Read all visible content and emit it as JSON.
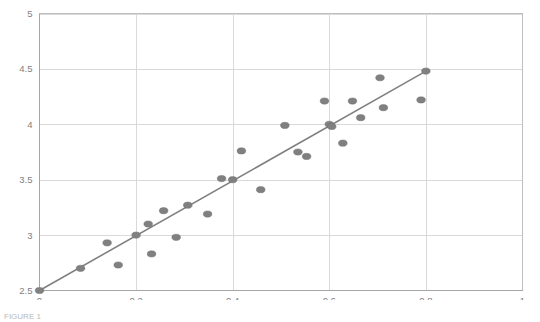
{
  "chart_data": {
    "type": "scatter",
    "title": "",
    "xlabel": "",
    "ylabel": "",
    "xlim": [
      0,
      1
    ],
    "ylim": [
      2.5,
      5
    ],
    "grid": true,
    "legend": null,
    "xticks": [
      "0",
      "0.2",
      "0.4",
      "0.6",
      "0.8",
      "1"
    ],
    "xtick_values": [
      0,
      0.2,
      0.4,
      0.6,
      0.8,
      1
    ],
    "yticks": [
      "2.5",
      "3",
      "3.5",
      "4",
      "4.5",
      "5"
    ],
    "ytick_values": [
      2.5,
      3,
      3.5,
      4,
      4.5,
      5
    ],
    "marker_color": "#808080",
    "line_color": "#808080",
    "grid_color": "#d9d9d9",
    "series": [
      {
        "name": "observations",
        "type": "scatter",
        "points": [
          [
            0.0,
            2.5
          ],
          [
            0.085,
            2.7
          ],
          [
            0.14,
            2.93
          ],
          [
            0.163,
            2.73
          ],
          [
            0.2,
            3.0
          ],
          [
            0.225,
            3.1
          ],
          [
            0.232,
            2.83
          ],
          [
            0.257,
            3.22
          ],
          [
            0.283,
            2.98
          ],
          [
            0.307,
            3.27
          ],
          [
            0.348,
            3.19
          ],
          [
            0.377,
            3.51
          ],
          [
            0.4,
            3.5
          ],
          [
            0.418,
            3.76
          ],
          [
            0.458,
            3.41
          ],
          [
            0.508,
            3.99
          ],
          [
            0.535,
            3.75
          ],
          [
            0.553,
            3.71
          ],
          [
            0.59,
            4.21
          ],
          [
            0.6,
            4.0
          ],
          [
            0.605,
            3.98
          ],
          [
            0.628,
            3.83
          ],
          [
            0.648,
            4.21
          ],
          [
            0.665,
            4.06
          ],
          [
            0.705,
            4.42
          ],
          [
            0.712,
            4.15
          ],
          [
            0.79,
            4.22
          ],
          [
            0.8,
            4.48
          ]
        ]
      },
      {
        "name": "trend-line",
        "type": "line",
        "points": [
          [
            0.0,
            2.5
          ],
          [
            0.8,
            4.48
          ]
        ]
      }
    ]
  },
  "caption": {
    "text": "FIGURE 1"
  }
}
